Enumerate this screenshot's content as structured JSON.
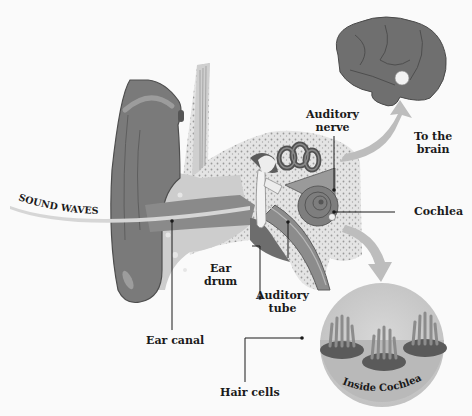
{
  "diagram": {
    "labels": {
      "sound_waves": "SOUND WAVES",
      "auditory_nerve_line1": "Auditory",
      "auditory_nerve_line2": "nerve",
      "to_brain_line1": "To the",
      "to_brain_line2": "brain",
      "cochlea": "Cochlea",
      "ear_drum_line1": "Ear",
      "ear_drum_line2": "drum",
      "auditory_tube_line1": "Auditory",
      "auditory_tube_line2": "tube",
      "ear_canal": "Ear canal",
      "hair_cells": "Hair cells",
      "inside_cochlea": "Inside Cochlea"
    },
    "nodes": [
      "Sound waves",
      "Ear canal",
      "Ear drum",
      "Auditory tube",
      "Cochlea",
      "Auditory nerve",
      "Brain",
      "Inside Cochlea",
      "Hair cells"
    ],
    "edges": [
      {
        "from": "Sound waves",
        "to": "Ear canal"
      },
      {
        "from": "Cochlea",
        "to": "Brain",
        "label": "To the brain"
      },
      {
        "from": "Cochlea",
        "to": "Inside Cochlea"
      }
    ],
    "colors": {
      "background": "#fafafa",
      "outer_ear": "#7a7a7a",
      "outer_ear_dark": "#5e5e5e",
      "tissue": "#c8c8c8",
      "bone_speckle": "#dcdcdc",
      "brain": "#6f6f6f",
      "arrow": "#bdbdbd",
      "circle": "#cfcfcf",
      "text": "#1a1a1a"
    }
  }
}
